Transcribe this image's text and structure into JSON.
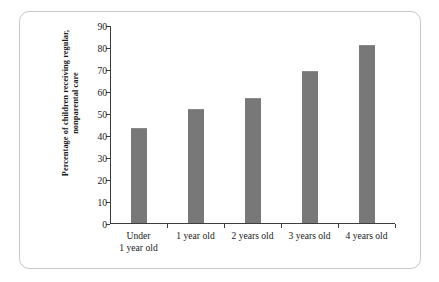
{
  "chart_data": {
    "type": "bar",
    "title": "",
    "subtitle": "",
    "xlabel": "",
    "ylabel": "Percentage of children receiving regular, nonparental care",
    "ylabel_line1": "Percentage of children receiving regular,",
    "ylabel_line2": "nonparental care",
    "categories": [
      "Under 1 year old",
      "1 year old",
      "2 years old",
      "3 years old",
      "4 years old"
    ],
    "category_lines": [
      [
        "Under",
        "1 year old"
      ],
      [
        "1 year old"
      ],
      [
        "2 years old"
      ],
      [
        "3 years old"
      ],
      [
        "4 years old"
      ]
    ],
    "values": [
      43,
      52,
      57,
      69,
      81
    ],
    "ylim": [
      0,
      90
    ],
    "ytick_step": 10,
    "yticks": [
      0,
      10,
      20,
      30,
      40,
      50,
      60,
      70,
      80,
      90
    ],
    "grid": false,
    "legend": "none",
    "bar_color": "#787878",
    "axis_color": "#3d3d3d",
    "text_color": "#1a1a1a",
    "frame_color": "#c9c9c9",
    "background_color": "#ffffff"
  }
}
